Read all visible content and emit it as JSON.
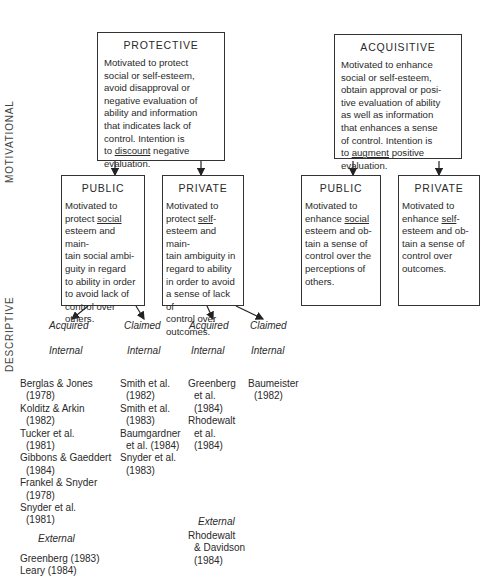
{
  "axis_labels": {
    "motivational": "MOTIVATIONAL",
    "descriptive": "DESCRIPTIVE"
  },
  "protective": {
    "title": "PROTECTIVE",
    "body_pre": "  Motivated to protect\nsocial or self-esteem,\navoid disapproval or\nnegative evaluation of\nability and information\nthat indicates lack of\ncontrol.  Intention is\nto ",
    "body_underlined": "discount",
    "body_post": " negative\nevaluation."
  },
  "acquisitive": {
    "title": "ACQUISITIVE",
    "body_pre": "  Motivated to enhance\nsocial or self-esteem,\nobtain approval or posi-\ntive evaluation of ability\nas well as information\nthat enhances a sense\nof control.  Intention is\nto ",
    "body_underlined": "augment",
    "body_post": " positive\nevaluation."
  },
  "protective_public": {
    "title": "PUBLIC",
    "body_pre": "  Motivated to\nprotect ",
    "body_underlined": "social",
    "body_post": "\nesteem and main-\ntain social ambi-\nguity in regard\nto ability in order\nto avoid lack of\ncontrol over\nothers."
  },
  "protective_private": {
    "title": "PRIVATE",
    "body_pre": "  Motivated to\nprotect ",
    "body_underlined": "self",
    "body_post": "-\nesteem and main-\ntain ambiguity in\nregard to ability\nin order to avoid\na sense of lack of\ncontrol over\noutcomes."
  },
  "acquisitive_public": {
    "title": "PUBLIC",
    "body_pre": "  Motivated to\nenhance ",
    "body_underlined": "social",
    "body_post": "\nesteem and ob-\ntain a sense of\ncontrol over the\nperceptions of\nothers."
  },
  "acquisitive_private": {
    "title": "PRIVATE",
    "body_pre": "  Motivated to\nenhance ",
    "body_underlined": "self",
    "body_post": "-\nesteem and ob-\ntain a sense of\ncontrol over\noutcomes."
  },
  "descriptive": {
    "labels": [
      "Acquired",
      "Claimed",
      "Acquired",
      "Claimed"
    ],
    "internal": [
      "Internal",
      "Internal",
      "Internal",
      "Internal"
    ],
    "external": [
      "External",
      "External"
    ]
  },
  "references": {
    "public_acquired_internal": [
      {
        "name": "Berglas & Jones",
        "year": "(1978)"
      },
      {
        "name": "Kolditz & Arkin",
        "year": "(1982)"
      },
      {
        "name": "Tucker et al.",
        "year": "(1981)"
      },
      {
        "name": "Gibbons & Gaeddert",
        "year": "(1984)"
      },
      {
        "name": "Frankel & Snyder",
        "year": "(1978)"
      },
      {
        "name": "Snyder et al.",
        "year": "(1981)"
      }
    ],
    "public_acquired_external": [
      {
        "name": "Greenberg (1983)",
        "year": ""
      },
      {
        "name": "Leary (1984)",
        "year": ""
      }
    ],
    "public_claimed_internal": [
      {
        "name": "Smith et al.",
        "year": "(1982)"
      },
      {
        "name": "Smith et al.",
        "year": "(1983)"
      },
      {
        "name": "Baumgardner",
        "year": "et al. (1984)"
      },
      {
        "name": "Snyder et al.",
        "year": "(1983)"
      }
    ],
    "private_acquired_internal": [
      {
        "name": "Greenberg",
        "year": "et al."
      },
      {
        "name": "",
        "year": "(1984)"
      },
      {
        "name": "Rhodewalt",
        "year": "et al."
      },
      {
        "name": "",
        "year": "(1984)"
      }
    ],
    "private_acquired_external": [
      {
        "name": "Rhodewalt",
        "year": "& Davidson"
      },
      {
        "name": "",
        "year": "(1984)"
      }
    ],
    "private_claimed_internal": [
      {
        "name": "Baumeister",
        "year": "(1982)"
      }
    ]
  }
}
